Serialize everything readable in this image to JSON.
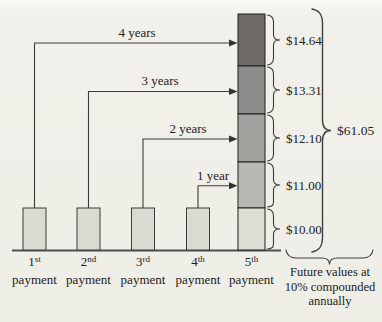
{
  "figure": {
    "arrows": [
      {
        "label": "4 years"
      },
      {
        "label": "3 years"
      },
      {
        "label": "2 years"
      },
      {
        "label": "1 year"
      }
    ],
    "bar": {
      "segments": [
        {
          "value": "$14.64",
          "color": "#6d6a68"
        },
        {
          "value": "$13.31",
          "color": "#8c8c8a"
        },
        {
          "value": "$12.10",
          "color": "#a2a39f"
        },
        {
          "value": "$11.00",
          "color": "#b7b8b3"
        },
        {
          "value": "$10.00",
          "color": "#deddd5"
        }
      ],
      "total": "$61.05"
    },
    "payments": [
      {
        "ordinal": "1",
        "suffix": "st",
        "word": "payment"
      },
      {
        "ordinal": "2",
        "suffix": "nd",
        "word": "payment"
      },
      {
        "ordinal": "3",
        "suffix": "rd",
        "word": "payment"
      },
      {
        "ordinal": "4",
        "suffix": "th",
        "word": "payment"
      },
      {
        "ordinal": "5",
        "suffix": "th",
        "word": "payment"
      }
    ],
    "note": {
      "line1": "Future values at",
      "line2": "10% compounded",
      "line3": "annually"
    },
    "colors": {
      "payment_box": "#dbdad2",
      "line": "#3c3c3c",
      "background": "#f0efe9"
    }
  }
}
